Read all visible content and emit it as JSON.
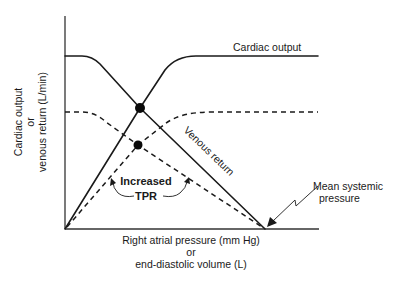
{
  "figure": {
    "y_axis_label": [
      "Cardiac output",
      "or",
      "venous return (L/min)"
    ],
    "x_axis_label": [
      "Right atrial pressure (mm Hg)",
      "or",
      "end-diastolic volume (L)"
    ],
    "curve_labels": {
      "cardiac_output": "Cardiac output",
      "venous_return": "Venous return"
    },
    "annotations": {
      "increased": "Increased",
      "tpr": "TPR",
      "mean_systemic_line1": "Mean systemic",
      "mean_systemic_line2": "pressure"
    },
    "curves": [
      {
        "name": "Cardiac output (control)",
        "style": "solid",
        "shape": "rises linearly from origin, plateaus high"
      },
      {
        "name": "Venous return (control)",
        "style": "solid",
        "shape": "plateau high at low RAP, declines linearly to mean systemic pressure"
      },
      {
        "name": "Cardiac output (increased TPR)",
        "style": "dashed",
        "shape": "rises less steeply from origin, plateaus lower"
      },
      {
        "name": "Venous return (increased TPR)",
        "style": "dashed",
        "shape": "lower plateau, declines to same mean systemic pressure"
      }
    ],
    "equilibrium_points": [
      {
        "label": "control",
        "description": "intersection of solid curves"
      },
      {
        "label": "increased TPR",
        "description": "intersection of dashed curves (lower cardiac output)"
      }
    ],
    "colors": {
      "ink": "#1a1a1a",
      "background": "#ffffff"
    }
  }
}
